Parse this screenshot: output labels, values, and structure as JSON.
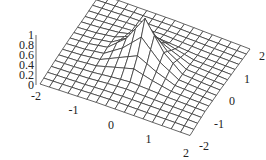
{
  "chart_data": {
    "type": "surface3d",
    "title": "",
    "xlabel": "",
    "ylabel": "",
    "zlabel": "",
    "x": [
      -2,
      -1.5,
      -1,
      -0.5,
      0,
      0.5,
      1,
      1.5,
      2
    ],
    "y": [
      -2,
      -1.5,
      -1,
      -0.5,
      0,
      0.5,
      1,
      1.5,
      2
    ],
    "z": [
      [
        0.02,
        0.04,
        0.06,
        0.08,
        0.09,
        0.1,
        0.11,
        0.12,
        0.13
      ],
      [
        0.03,
        0.05,
        0.07,
        0.1,
        0.12,
        0.13,
        0.14,
        0.15,
        0.15
      ],
      [
        0.04,
        0.06,
        0.09,
        0.14,
        0.18,
        0.17,
        0.16,
        0.16,
        0.16
      ],
      [
        0.04,
        0.07,
        0.12,
        0.3,
        0.48,
        0.3,
        0.17,
        0.16,
        0.15
      ],
      [
        0.04,
        0.07,
        0.14,
        0.46,
        1.0,
        0.46,
        0.17,
        0.15,
        0.14
      ],
      [
        0.03,
        0.06,
        0.12,
        0.28,
        0.44,
        0.28,
        0.14,
        0.13,
        0.12
      ],
      [
        0.02,
        0.05,
        0.08,
        0.11,
        0.14,
        0.12,
        0.1,
        0.1,
        0.1
      ],
      [
        0.02,
        0.04,
        0.06,
        0.07,
        0.08,
        0.08,
        0.08,
        0.08,
        0.08
      ],
      [
        0.01,
        0.03,
        0.04,
        0.05,
        0.06,
        0.06,
        0.06,
        0.06,
        0.06
      ]
    ],
    "x_ticks": [
      "-2",
      "-1",
      "0",
      "1",
      "2"
    ],
    "y_ticks": [
      "-2",
      "-1",
      "0",
      "1",
      "2"
    ],
    "z_ticks": [
      "0",
      "0.2",
      "0.4",
      "0.6",
      "0.8",
      "1"
    ],
    "xlim": [
      -2,
      2
    ],
    "ylim": [
      -2,
      2
    ],
    "zlim": [
      0,
      1
    ],
    "grid": false,
    "legend": "none",
    "mesh_subdivisions": 2,
    "colors": {
      "mesh_line": "#333333",
      "mesh_fill": "#ffffff",
      "text": "#222222"
    }
  }
}
